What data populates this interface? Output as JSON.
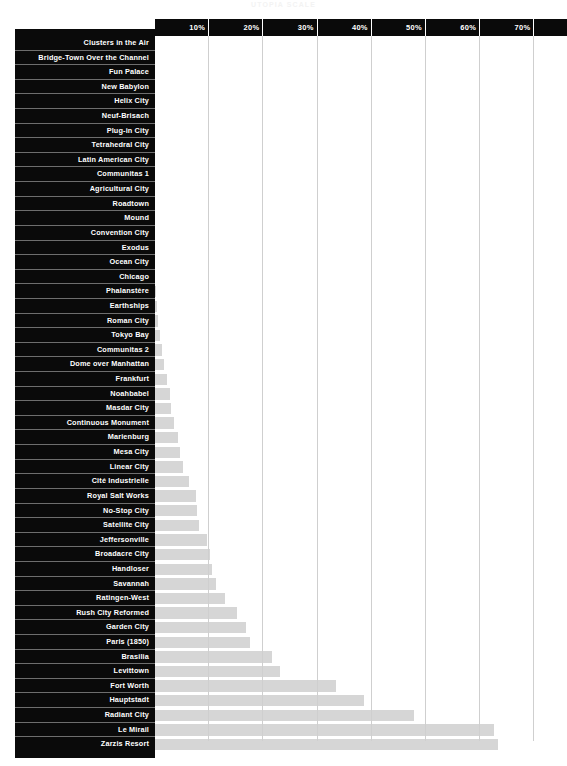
{
  "chart_title": "UTOPIA SCALE",
  "chart_data": {
    "type": "bar",
    "orientation": "horizontal",
    "title": "UTOPIA SCALE",
    "xlabel": "",
    "ylabel": "",
    "xlim": [
      0,
      76
    ],
    "grid": true,
    "legend": false,
    "tick_labels": [
      "10%",
      "20%",
      "30%",
      "40%",
      "50%",
      "60%",
      "70%"
    ],
    "tick_values": [
      10,
      20,
      30,
      40,
      50,
      60,
      70
    ],
    "categories": [
      "Clusters in the Air",
      "Bridge-Town Over the Channel",
      "Fun Palace",
      "New Babylon",
      "Helix City",
      "Neuf-Brisach",
      "Plug-in City",
      "Tetrahedral City",
      "Latin American City",
      "Communitas 1",
      "Agricultural City",
      "Roadtown",
      "Mound",
      "Convention City",
      "Exodus",
      "Ocean City",
      "Chicago",
      "Phalanstère",
      "Earthships",
      "Roman City",
      "Tokyo Bay",
      "Communitas 2",
      "Dome over Manhattan",
      "Frankfurt",
      "Noahbabel",
      "Masdar City",
      "Continuous Monument",
      "Marienburg",
      "Mesa City",
      "Linear City",
      "Cité Industrielle",
      "Royal Salt Works",
      "No-Stop City",
      "Satellite City",
      "Jeffersonville",
      "Broadacre City",
      "Handloser",
      "Savannah",
      "Ratingen-West",
      "Rush City Reformed",
      "Garden City",
      "Paris (1850)",
      "Brasilia",
      "Levittown",
      "Fort Worth",
      "Hauptstadt",
      "Radiant City",
      "Le Mirail",
      "Zarzis Resort"
    ],
    "values": [
      0.0,
      0.0,
      0.0,
      0.0,
      0.0,
      0.0,
      0.0,
      0.0,
      0.0,
      0.0,
      0.0,
      0.0,
      0.0,
      0.0,
      0.0,
      0.0,
      0.0,
      0.2,
      0.3,
      0.5,
      1.0,
      1.3,
      1.6,
      2.2,
      2.8,
      2.9,
      3.5,
      4.3,
      4.6,
      5.1,
      6.3,
      7.6,
      7.8,
      8.2,
      9.6,
      10.2,
      10.6,
      11.2,
      13.0,
      15.2,
      16.7,
      17.6,
      21.5,
      23.1,
      33.4,
      38.5,
      47.7,
      62.5,
      63.2
    ],
    "value_unit": "%",
    "bar_color": "#d6d6d6",
    "label_background": "#0a0a0a",
    "label_color": "#ffffff",
    "gridline_color": "#cfcfcf"
  }
}
